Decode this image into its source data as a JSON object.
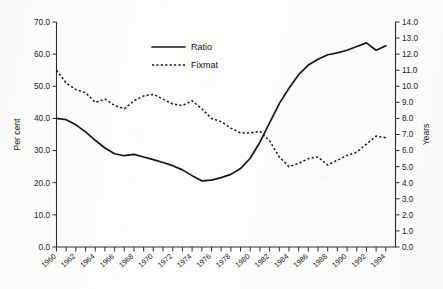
{
  "chart_data": {
    "type": "line",
    "title": "",
    "xlabel": "",
    "ylabel": "Per cent",
    "y2label": "Years",
    "grid": false,
    "legend_position": "top-center",
    "xlim": [
      1960,
      1995
    ],
    "ylim": [
      0.0,
      70.0
    ],
    "y2lim": [
      0.0,
      14.0
    ],
    "x": [
      1960,
      1961,
      1962,
      1963,
      1964,
      1965,
      1966,
      1967,
      1968,
      1969,
      1970,
      1971,
      1972,
      1973,
      1974,
      1975,
      1976,
      1977,
      1978,
      1979,
      1980,
      1981,
      1982,
      1983,
      1984,
      1985,
      1986,
      1987,
      1988,
      1989,
      1990,
      1991,
      1992,
      1993,
      1994
    ],
    "xtick_labels": [
      "1960",
      "1962",
      "1964",
      "1966",
      "1968",
      "1970",
      "1972",
      "1974",
      "1976",
      "1978",
      "1980",
      "1982",
      "1984",
      "1986",
      "1988",
      "1990",
      "1992",
      "1994"
    ],
    "ytick_labels": [
      "0.0",
      "10.0",
      "20.0",
      "30.0",
      "40.0",
      "50.0",
      "60.0",
      "70.0"
    ],
    "y2tick_labels": [
      "0.0",
      "1.0",
      "2.0",
      "3.0",
      "4.0",
      "5.0",
      "6.0",
      "7.0",
      "8.0",
      "9.0",
      "10.0",
      "11.0",
      "12.0",
      "13.0",
      "14.0"
    ],
    "series": [
      {
        "name": "Ratio",
        "axis": "left",
        "style": "solid",
        "unit": "per cent",
        "values": [
          40.0,
          39.6,
          38.0,
          35.8,
          33.2,
          30.8,
          29.0,
          28.4,
          28.8,
          28.0,
          27.2,
          26.3,
          25.3,
          24.0,
          22.2,
          20.6,
          20.8,
          21.6,
          22.6,
          24.4,
          27.6,
          32.6,
          38.6,
          44.6,
          49.4,
          53.6,
          56.6,
          58.4,
          59.8,
          60.4,
          61.2,
          62.4,
          63.5,
          61.2,
          62.6
        ]
      },
      {
        "name": "Fixmat",
        "axis": "right",
        "style": "dashed",
        "unit": "years",
        "values": [
          11.0,
          10.2,
          9.8,
          9.6,
          9.0,
          9.2,
          8.8,
          8.6,
          9.1,
          9.4,
          9.5,
          9.2,
          8.9,
          8.8,
          9.1,
          8.6,
          8.0,
          7.8,
          7.4,
          7.1,
          7.1,
          7.2,
          6.6,
          5.6,
          5.0,
          5.2,
          5.5,
          5.6,
          5.1,
          5.4,
          5.7,
          5.9,
          6.4,
          6.9,
          6.8
        ]
      }
    ]
  },
  "legend": {
    "items": [
      {
        "label": "Ratio",
        "style": "solid"
      },
      {
        "label": "Fixmat",
        "style": "dashed"
      }
    ]
  }
}
